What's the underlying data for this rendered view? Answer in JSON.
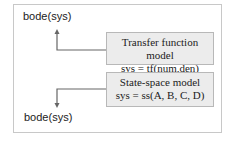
{
  "diagram": {
    "top_output": "bode(sys)",
    "bottom_output": "bode(sys)",
    "boxes": [
      {
        "title": "Transfer function model",
        "code": "sys = tf(num,den)"
      },
      {
        "title": "State-space model",
        "code": "sys = ss(A, B, C, D)"
      }
    ],
    "colors": {
      "box_fill": "#ececec",
      "arrow": "#666666",
      "frame": "#c8c8c8"
    }
  }
}
